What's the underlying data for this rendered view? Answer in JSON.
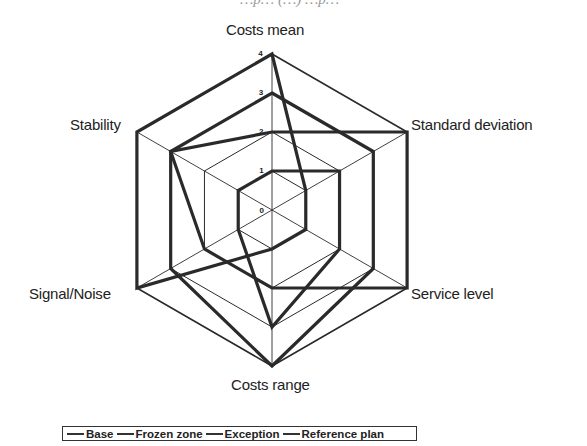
{
  "header": {
    "cut_off_title": "…p… (…) …p…"
  },
  "chart_data": {
    "type": "radar",
    "title": "",
    "axes": [
      "Costs mean",
      "Standard deviation",
      "Service level",
      "Costs range",
      "Signal/Noise",
      "Stability"
    ],
    "radial_ticks": [
      "0",
      "1",
      "2",
      "3",
      "4"
    ],
    "rlim": [
      0,
      4
    ],
    "grid": true,
    "legend_position": "bottom",
    "series": [
      {
        "name": "Base",
        "values": [
          4,
          1,
          1,
          1,
          4,
          4
        ]
      },
      {
        "name": "Frozen zone",
        "values": [
          3,
          3,
          3,
          4,
          3,
          3
        ]
      },
      {
        "name": "Exception",
        "values": [
          2,
          4,
          4,
          2,
          2,
          3
        ]
      },
      {
        "name": "Reference plan",
        "values": [
          1,
          2,
          2,
          3,
          1,
          1
        ]
      }
    ],
    "colors": {
      "grid": "#2a2a2a",
      "series": "#2a2a2a"
    }
  },
  "legend": {
    "items": [
      "Base",
      "Frozen zone",
      "Exception",
      "Reference plan"
    ]
  }
}
